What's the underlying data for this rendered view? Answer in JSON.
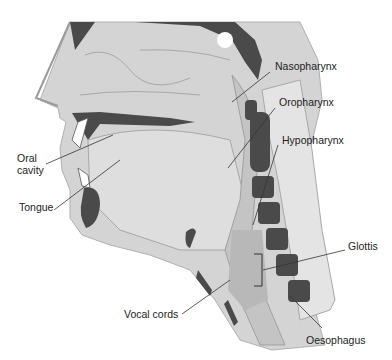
{
  "diagram": {
    "colors": {
      "soft_tissue": "#d4d4d4",
      "inner_tissue": "#e2e2e2",
      "bone_dark": "#4a4a4a",
      "airway": "#c4c4c4",
      "outline": "#9a9a9a",
      "leader": "#333333",
      "text": "#222222"
    },
    "labels": [
      {
        "id": "nasopharynx",
        "text": "Nasopharynx",
        "x": 275,
        "y": 66
      },
      {
        "id": "oropharynx",
        "text": "Oropharynx",
        "x": 279,
        "y": 102
      },
      {
        "id": "hypopharynx",
        "text": "Hypopharynx",
        "x": 282,
        "y": 139
      },
      {
        "id": "oral-cavity",
        "text": "Oral\ncavity",
        "x": 17,
        "y": 156
      },
      {
        "id": "tongue",
        "text": "Tongue",
        "x": 19,
        "y": 206
      },
      {
        "id": "glottis",
        "text": "Glottis",
        "x": 348,
        "y": 244
      },
      {
        "id": "vocal-cords",
        "text": "Vocal cords",
        "x": 124,
        "y": 306
      },
      {
        "id": "oesophagus",
        "text": "Oesophagus",
        "x": 306,
        "y": 335
      }
    ]
  }
}
